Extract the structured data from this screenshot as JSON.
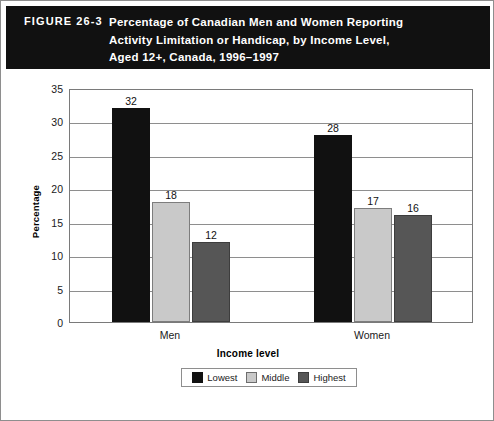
{
  "figure": {
    "number_label": "FIGURE 26-3",
    "title_lines": [
      "Percentage of Canadian Men and Women Reporting",
      "Activity Limitation or Handicap, by Income Level,",
      "Aged 12+, Canada, 1996–1997"
    ]
  },
  "colors": {
    "header_background": "#111111",
    "header_text": "#ffffff",
    "lowest": "#111111",
    "middle": "#c9c9c9",
    "highest": "#565656",
    "gridline": "#8e8e8e",
    "frame": "#8e8e8e"
  },
  "chart_data": {
    "type": "bar",
    "title": "Percentage of Canadian Men and Women Reporting Activity Limitation or Handicap, by Income Level, Aged 12+, Canada, 1996–1997",
    "xlabel": "Income level",
    "ylabel": "Percentage",
    "categories": [
      "Men",
      "Women"
    ],
    "series": [
      {
        "name": "Lowest",
        "values": [
          32,
          18
        ]
      },
      {
        "name": "Middle",
        "values": [
          18,
          17
        ]
      },
      {
        "name": "Highest",
        "values": [
          12,
          16
        ]
      }
    ],
    "series_corrected": [
      {
        "name": "Lowest",
        "values": [
          32,
          28
        ]
      },
      {
        "name": "Middle",
        "values": [
          18,
          17
        ]
      },
      {
        "name": "Highest",
        "values": [
          12,
          16
        ]
      }
    ],
    "ylim": [
      0,
      35
    ],
    "yticks": [
      0,
      5,
      10,
      15,
      20,
      25,
      30,
      35
    ],
    "ytick_labels": [
      "0",
      "5",
      "10",
      "15",
      "20",
      "25",
      "30",
      "35"
    ],
    "grid": true,
    "legend_position": "bottom",
    "bar_labels": {
      "Men": [
        "32",
        "18",
        "12"
      ],
      "Women": [
        "28",
        "17",
        "16"
      ]
    }
  },
  "legend": {
    "items": [
      {
        "label": "Lowest"
      },
      {
        "label": "Middle"
      },
      {
        "label": "Highest"
      }
    ]
  }
}
